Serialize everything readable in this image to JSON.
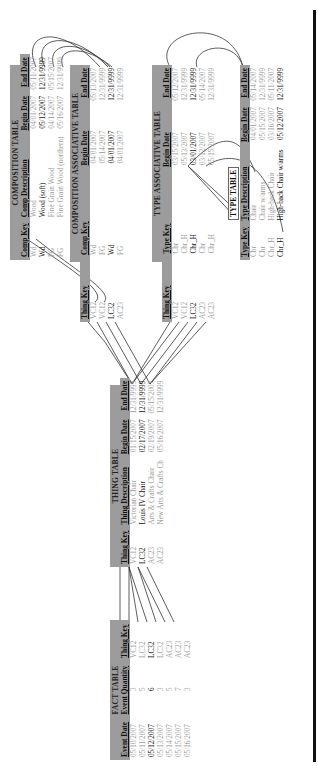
{
  "fact_table": {
    "title": "FACT TABLE",
    "columns": [
      "Event Date",
      "Event Quantity",
      "Thing Key"
    ],
    "rows": [
      {
        "date": "05/10/2007",
        "qty": "3",
        "key": "VC12",
        "bold": false
      },
      {
        "date": "05/11/2007",
        "qty": "5",
        "key": "LC32",
        "bold": false
      },
      {
        "date": "05/12/2007",
        "qty": "6",
        "key": "LC32",
        "bold": true
      },
      {
        "date": "05/13/2007",
        "qty": "3",
        "key": "LC32",
        "bold": false
      },
      {
        "date": "05/14/2007",
        "qty": "5",
        "key": "AC23",
        "bold": false
      },
      {
        "date": "05/15/2007",
        "qty": "7",
        "key": "AC23",
        "bold": false
      },
      {
        "date": "05/16/2007",
        "qty": "3",
        "key": "AC23",
        "bold": false
      }
    ]
  },
  "thing_table": {
    "title": "THING TABLE",
    "columns": [
      "Thing Key",
      "Thing Description",
      "Begin Date",
      "End Date"
    ],
    "rows": [
      {
        "key": "VC12",
        "desc": "Victorian Chair",
        "begin": "01/15/2007",
        "end": "12/31/9999",
        "bold": false
      },
      {
        "key": "LC32",
        "desc": "Louis IV Chair",
        "begin": "02/17/2007",
        "end": "12/31/9999",
        "bold": true
      },
      {
        "key": "AC23",
        "desc": "Arts & Crafts Chair",
        "begin": "02/19/2007",
        "end": "05/15/2007",
        "bold": false
      },
      {
        "key": "AC23",
        "desc": "New Arts & Crafts Ch",
        "begin": "05/16/2007",
        "end": "12/31/9999",
        "bold": false
      }
    ]
  },
  "composition_table": {
    "title": "COMPOSITION TABLE",
    "columns": [
      "Comp Key",
      "Comp Description",
      "Begin Date",
      "End Date"
    ],
    "rows": [
      {
        "key": "Wd",
        "desc": "Wood",
        "begin": "04/01/2007",
        "end": "05/11/2007",
        "bold": false
      },
      {
        "key": "Wd",
        "desc": "Wood (soft)",
        "begin": "05/12/2007",
        "end": "12/31/9999",
        "bold": true
      },
      {
        "key": "FG",
        "desc": "Fine Grain Wood",
        "begin": "04/14/2007",
        "end": "05/15/2007",
        "bold": false
      },
      {
        "key": "FG",
        "desc": "Fine Grain Wood (northern)",
        "begin": "05/16/2007",
        "end": "12/31/9999",
        "bold": false
      }
    ]
  },
  "composition_associative_table": {
    "title": "COMPOSITION ASSOCIATIVE TABLE",
    "columns": [
      "Thing Key",
      "Comp Key",
      "Begin Date",
      "End Date"
    ],
    "rows": [
      {
        "thing": "VC12",
        "comp": "Wd",
        "begin": "04/01/2007",
        "end": "05/13/2007",
        "bold": false
      },
      {
        "thing": "VC12",
        "comp": "FG",
        "begin": "05/14/2007",
        "end": "12/31/9999",
        "bold": false
      },
      {
        "thing": "LC32",
        "comp": "Wd",
        "begin": "04/01/2007",
        "end": "12/31/9999",
        "bold": true
      },
      {
        "thing": "AC23",
        "comp": "FG",
        "begin": "04/01/2007",
        "end": "12/31/9999",
        "bold": false
      }
    ]
  },
  "type_associative_table": {
    "title": "TYPE ASSOCIATIVE TABLE",
    "columns": [
      "Thing Key",
      "Type Key",
      "Begin Date",
      "End Date"
    ],
    "rows": [
      {
        "thing": "VC12",
        "type": "Chr",
        "begin": "03/15/2007",
        "end": "05/12/2007",
        "bold": false
      },
      {
        "thing": "VC12",
        "type": "Chr_H",
        "begin": "05/13/2007",
        "end": "12/31/9999",
        "bold": false
      },
      {
        "thing": "LC32",
        "type": "Chr_H",
        "begin": "03/01/2007",
        "end": "12/31/9999",
        "bold": true
      },
      {
        "thing": "AC23",
        "type": "Chr",
        "begin": "03/12/2007",
        "end": "05/14/2007",
        "bold": false
      },
      {
        "thing": "AC23",
        "type": "Chr_H",
        "begin": "05/15/2007",
        "end": "12/31/9999",
        "bold": false
      }
    ]
  },
  "type_table": {
    "title": "TYPE TABLE",
    "columns": [
      "Type Key",
      "Type Description",
      "Begin Date",
      "End Date"
    ],
    "rows": [
      {
        "key": "Chr",
        "desc": "Chair",
        "begin": "04/01/2007",
        "end": "05/14/2007",
        "bold": false
      },
      {
        "key": "Chr",
        "desc": "Chair w/arms",
        "begin": "05/15/2007",
        "end": "12/31/9999",
        "bold": false
      },
      {
        "key": "Chr_H",
        "desc": "High-back Chair",
        "begin": "03/16/2007",
        "end": "05/11/2007",
        "bold": false
      },
      {
        "key": "Chr_H",
        "desc": "High-back Chair w/arms",
        "begin": "05/12/2007",
        "end": "12/31/9999",
        "bold": true
      }
    ]
  },
  "colors": {
    "header_bg": "#9c9c9c",
    "muted_text": "#9a9a9a",
    "bold_text": "#111111",
    "rule": "#111111"
  }
}
